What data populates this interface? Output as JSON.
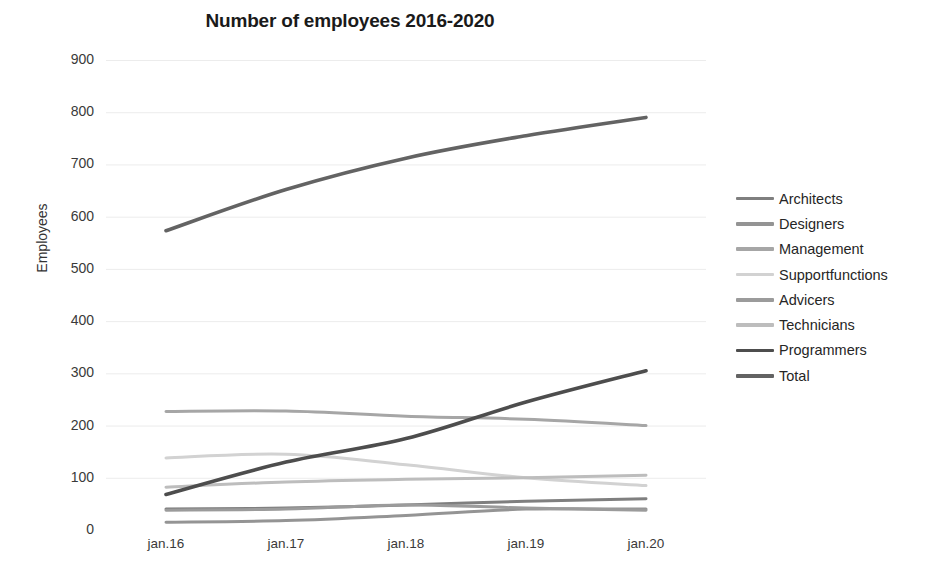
{
  "chart_data": {
    "type": "line",
    "title": "Number of employees 2016-2020",
    "xlabel": "",
    "ylabel": "Employees",
    "categories": [
      "jan.16",
      "jan.17",
      "jan.18",
      "jan.19",
      "jan.20"
    ],
    "ylim": [
      0,
      900
    ],
    "ytick_values": [
      0,
      100,
      200,
      300,
      400,
      500,
      600,
      700,
      800,
      900
    ],
    "ytick_labels": [
      "0",
      "100",
      "200",
      "300",
      "400",
      "500",
      "600",
      "700",
      "800",
      "900"
    ],
    "grid": true,
    "legend_position": "right",
    "series": [
      {
        "name": "Architects",
        "color": "#7f7f7f",
        "width": 3.0,
        "values": [
          40,
          42,
          48,
          55,
          60
        ]
      },
      {
        "name": "Designers",
        "color": "#949494",
        "width": 3.0,
        "values": [
          15,
          18,
          28,
          40,
          40
        ]
      },
      {
        "name": "Management",
        "color": "#a6a6a6",
        "width": 3.0,
        "values": [
          227,
          228,
          218,
          212,
          200
        ]
      },
      {
        "name": "Supportfunctions",
        "color": "#d2d2d2",
        "width": 3.0,
        "values": [
          138,
          145,
          125,
          100,
          85
        ]
      },
      {
        "name": "Advicers",
        "color": "#9b9b9b",
        "width": 3.0,
        "values": [
          38,
          40,
          48,
          42,
          38
        ]
      },
      {
        "name": "Technicians",
        "color": "#bdbdbd",
        "width": 3.0,
        "values": [
          82,
          92,
          97,
          100,
          105
        ]
      },
      {
        "name": "Programmers",
        "color": "#4d4d4d",
        "width": 3.6,
        "values": [
          68,
          130,
          175,
          245,
          305
        ]
      },
      {
        "name": "Total",
        "color": "#636363",
        "width": 3.6,
        "values": [
          573,
          652,
          712,
          755,
          790
        ]
      }
    ]
  },
  "colors": {
    "grid": "#ececec",
    "text": "#3a3a3a",
    "title": "#1a1a1a",
    "background": "#ffffff"
  }
}
